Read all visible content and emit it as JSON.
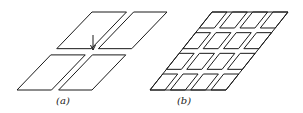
{
  "figure": {
    "panels": [
      {
        "id": "a",
        "label": "(a)",
        "description": "Plate divided by a cross-shaped gap (one slanted slot and one transverse slot) with an arrow pointing to the intersection",
        "outline": {
          "top_left": [
            92,
            12
          ],
          "width": 75,
          "height": 78,
          "shear": 75
        },
        "slot_u": [
          0.46,
          0.555
        ],
        "slot_v": [
          0.47,
          0.55
        ],
        "arrow": {
          "x": 93,
          "y1": 35,
          "y2": 50
        },
        "label_pos": [
          63,
          104
        ]
      },
      {
        "id": "b",
        "label": "(b)",
        "description": "Plate subdivided into a 4 x 4 array of separated parallelogram cells",
        "outline": {
          "top_left": [
            212,
            12
          ],
          "width": 76,
          "height": 78,
          "shear": 62
        },
        "rows": 4,
        "cols": 4,
        "gap_u": 0.07,
        "gap_v": 0.06,
        "label_pos": [
          184,
          104
        ]
      }
    ],
    "line_color": "#1a1a1a"
  }
}
